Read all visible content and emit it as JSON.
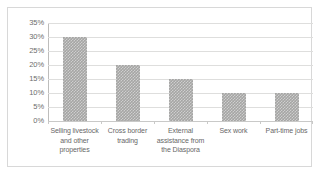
{
  "chart_data": {
    "type": "bar",
    "title": "",
    "subtitle": "",
    "xlabel": "",
    "ylabel": "",
    "categories": [
      "Selling livestock and other properties",
      "Cross border trading",
      "External assistance from the Diaspora",
      "Sex work",
      "Part-time jobs"
    ],
    "category_lines": [
      [
        "Selling livestock",
        "and other",
        "properties"
      ],
      [
        "Cross border",
        "trading"
      ],
      [
        "External",
        "assistance from",
        "the Diaspora"
      ],
      [
        "Sex work"
      ],
      [
        "Part-time jobs"
      ]
    ],
    "values": [
      30,
      20,
      15,
      10,
      10
    ],
    "value_unit": "%",
    "ylim": [
      0,
      35
    ],
    "ytick_values": [
      0,
      5,
      10,
      15,
      20,
      25,
      30,
      35
    ],
    "ytick_labels": [
      "0%",
      "5%",
      "10%",
      "15%",
      "20%",
      "25%",
      "30%",
      "35%"
    ],
    "grid": true,
    "grid_axis": "y",
    "legend": false,
    "legend_position": "none",
    "bar_color": "#a5a5a4",
    "bar_pattern": "fine-checker",
    "gridline_color": "#dededd",
    "axis_color": "#bdbdbc",
    "label_color": "#6d6d6d",
    "plot_background": "#ffffff",
    "border_color": "#d8d8d8"
  }
}
